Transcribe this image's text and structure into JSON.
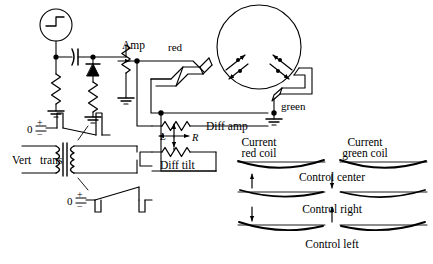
{
  "diagram": {
    "labels": {
      "amp": "Amp",
      "red": "red",
      "green": "green",
      "diff_amp": "Diff amp",
      "diff_tilt": "Diff tilt",
      "vert_trans_1": "Vert",
      "vert_trans_2": "trans",
      "left_arrow_label": "L",
      "right_arrow_label": "R",
      "zero_top": "0",
      "zero_bottom": "0",
      "plus_top": "+",
      "minus_top": "−",
      "plus_bottom": "+",
      "minus_bottom": "−"
    },
    "right_panel": {
      "heading_left_line1": "Current",
      "heading_left_line2": "red coil",
      "heading_right_line1": "Current",
      "heading_right_line2": "green coil",
      "rows": [
        {
          "caption": "Control center",
          "arrow": "down-arrow"
        },
        {
          "caption": "Control right",
          "arrow": "up-arrow"
        },
        {
          "caption": "Control left",
          "arrow": "none"
        }
      ]
    },
    "components": {
      "source": "pulse-source-symbol",
      "capacitor": "capacitor-symbol",
      "diode": "diode-symbol",
      "resistors": "resistor-symbol",
      "grounds": "ground-symbol",
      "potentiometer": "potentiometer-symbol",
      "transformer": "transformer-symbol",
      "crt": "crt-circle",
      "field_arrows": "magnetic-field-arrows"
    },
    "colors": {
      "ink": "#000000",
      "paper": "#ffffff"
    }
  }
}
